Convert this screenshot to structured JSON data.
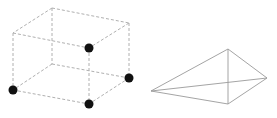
{
  "figures": [
    {
      "name": "cube",
      "edge_style": "dashed",
      "edge_color": "#b0b0b0",
      "vertices": {
        "btl": [
          52,
          8
        ],
        "btr": [
          129,
          23
        ],
        "ftl": [
          13,
          33
        ],
        "ftr": [
          89,
          48
        ],
        "bbl": [
          52,
          64
        ],
        "bbr": [
          129,
          78
        ],
        "fbl": [
          13,
          90
        ],
        "fbr": [
          89,
          104
        ]
      },
      "marked_vertices": [
        "ftr",
        "bbr",
        "fbl",
        "fbr"
      ],
      "dot_color": "#111111"
    },
    {
      "name": "tetrahedron",
      "edge_style": "solid",
      "edge_color": "#9a9a9a",
      "vertices": {
        "top": [
          228,
          49
        ],
        "left": [
          151,
          91
        ],
        "right": [
          267,
          78
        ],
        "bottom": [
          228,
          104
        ]
      }
    }
  ]
}
